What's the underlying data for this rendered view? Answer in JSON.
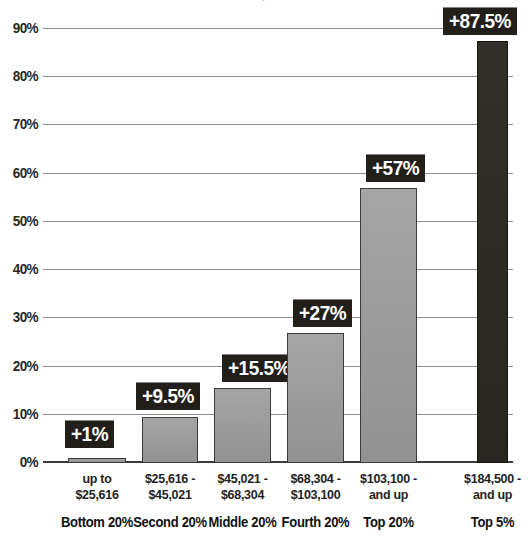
{
  "chart_data": {
    "type": "bar",
    "title": "",
    "clipped_title_fragment": "↓",
    "xlabel": "",
    "ylabel": "",
    "ylim": [
      0,
      95
    ],
    "grid": true,
    "legend": false,
    "y_ticks": [
      "0%",
      "10%",
      "20%",
      "30%",
      "40%",
      "50%",
      "60%",
      "70%",
      "80%",
      "90%"
    ],
    "y_tick_values": [
      0,
      10,
      20,
      30,
      40,
      50,
      60,
      70,
      80,
      90
    ],
    "categories": [
      "Bottom 20%",
      "Second 20%",
      "Middle 20%",
      "Fourth 20%",
      "Top 20%",
      "Top 5%"
    ],
    "category_ranges": [
      "up to\n$25,616",
      "$25,616 -\n$45,021",
      "$45,021 -\n$68,304",
      "$68,304 -\n$103,100",
      "$103,100 -\nand up",
      "$184,500 -\nand up"
    ],
    "values": [
      1,
      9.5,
      15.5,
      27,
      57,
      87.5
    ],
    "value_labels": [
      "+1%",
      "+9.5%",
      "+15.5%",
      "+27%",
      "+57%",
      "+87.5%"
    ],
    "bar_colors": [
      "#9b9b9b",
      "#9b9b9b",
      "#9b9b9b",
      "#9b9b9b",
      "#9b9b9b",
      "#2b2722"
    ]
  },
  "bars": [
    {
      "id": "bottom-20",
      "quintile": "Bottom 20%",
      "range_line1": "up to",
      "range_line2": "$25,616",
      "value": 1,
      "value_label": "+1%",
      "color": "#9b9b9b"
    },
    {
      "id": "second-20",
      "quintile": "Second 20%",
      "range_line1": "$25,616 -",
      "range_line2": "$45,021",
      "value": 9.5,
      "value_label": "+9.5%",
      "color": "#9b9b9b"
    },
    {
      "id": "middle-20",
      "quintile": "Middle 20%",
      "range_line1": "$45,021 -",
      "range_line2": "$68,304",
      "value": 15.5,
      "value_label": "+15.5%",
      "color": "#9b9b9b"
    },
    {
      "id": "fourth-20",
      "quintile": "Fourth 20%",
      "range_line1": "$68,304 -",
      "range_line2": "$103,100",
      "value": 27,
      "value_label": "+27%",
      "color": "#9b9b9b"
    },
    {
      "id": "top-20",
      "quintile": "Top 20%",
      "range_line1": "$103,100 -",
      "range_line2": "and up",
      "value": 57,
      "value_label": "+57%",
      "color": "#9b9b9b"
    },
    {
      "id": "top-5",
      "quintile": "Top 5%",
      "range_line1": "$184,500 -",
      "range_line2": "and up",
      "value": 87.5,
      "value_label": "+87.5%",
      "color": "#2b2722"
    }
  ],
  "axis": {
    "ticks": [
      {
        "label": "0%",
        "value": 0
      },
      {
        "label": "10%",
        "value": 10
      },
      {
        "label": "20%",
        "value": 20
      },
      {
        "label": "30%",
        "value": 30
      },
      {
        "label": "40%",
        "value": 40
      },
      {
        "label": "50%",
        "value": 50
      },
      {
        "label": "60%",
        "value": 60
      },
      {
        "label": "70%",
        "value": 70
      },
      {
        "label": "80%",
        "value": 80
      },
      {
        "label": "90%",
        "value": 90
      }
    ]
  },
  "colors": {
    "bar_gray": "#9b9b9b",
    "bar_dark": "#2b2722",
    "gridline": "#8e8e8e",
    "baseline": "#3a3a3a",
    "callout_bg": "#221f1b",
    "callout_text": "#ffffff",
    "text": "#1e1e1e",
    "background": "#ffffff"
  }
}
